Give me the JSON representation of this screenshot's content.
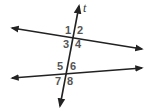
{
  "diagram": {
    "type": "parallel-lines-transversal",
    "line_color": "#222222",
    "label_color": "#555555",
    "transversal": {
      "label": "t",
      "start": [
        60,
        106
      ],
      "end": [
        79,
        6
      ]
    },
    "lines": [
      {
        "name": "top-line",
        "start": [
          12,
          28
        ],
        "end": [
          142,
          49
        ]
      },
      {
        "name": "bottom-line",
        "start": [
          12,
          78
        ],
        "end": [
          142,
          68
        ]
      }
    ],
    "angles": [
      {
        "label": "1",
        "x": 65,
        "y": 34
      },
      {
        "label": "2",
        "x": 77,
        "y": 34
      },
      {
        "label": "3",
        "x": 63,
        "y": 48
      },
      {
        "label": "4",
        "x": 75,
        "y": 48
      },
      {
        "label": "5",
        "x": 57,
        "y": 70
      },
      {
        "label": "6",
        "x": 70,
        "y": 70
      },
      {
        "label": "7",
        "x": 55,
        "y": 85
      },
      {
        "label": "8",
        "x": 67,
        "y": 85
      }
    ]
  }
}
